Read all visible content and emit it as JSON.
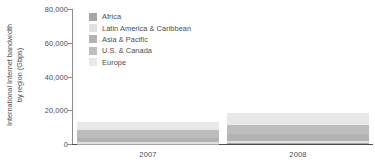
{
  "chart_data": {
    "type": "bar",
    "variant": "stacked-vertical",
    "title": "",
    "subtitle": "",
    "xlabel": "",
    "ylabel": "International Internet bandwidth by region (Gbps)",
    "ylabel_lines": [
      "International Internet bandwidth",
      "by region (Gbps)"
    ],
    "categories": [
      "2007",
      "2008"
    ],
    "ylim": [
      0,
      80000
    ],
    "yticks": [
      0,
      20000,
      40000,
      60000,
      80000
    ],
    "ytick_labels": [
      "0",
      "20,000",
      "40,000",
      "60,000",
      "80,000"
    ],
    "grid": false,
    "legend_position": "top-left-inside",
    "series": [
      {
        "name": "Africa",
        "color": "#a6a6a6",
        "values": [
          250,
          400
        ]
      },
      {
        "name": "Latin America & Caribbean",
        "color": "#e0e0e0",
        "values": [
          700,
          1100
        ]
      },
      {
        "name": "Asia & Pacific",
        "color": "#b3b3b3",
        "values": [
          2600,
          4200
        ]
      },
      {
        "name": "U.S. & Canada",
        "color": "#bdbdbd",
        "values": [
          4500,
          5600
        ]
      },
      {
        "name": "Europe",
        "color": "#e8e8e8",
        "values": [
          4950,
          7200
        ]
      }
    ],
    "totals": [
      13000,
      18500
    ]
  },
  "axis": {
    "y_tick_0": "0",
    "y_tick_1": "20,000",
    "y_tick_2": "40,000",
    "y_tick_3": "60,000",
    "y_tick_4": "80,000",
    "x_tick_0": "2007",
    "x_tick_1": "2008"
  },
  "colors": {
    "axis": "#4d4d4d",
    "axis_y": "#8c8c8c",
    "text": "#4d4d4d",
    "background": "#ffffff"
  }
}
